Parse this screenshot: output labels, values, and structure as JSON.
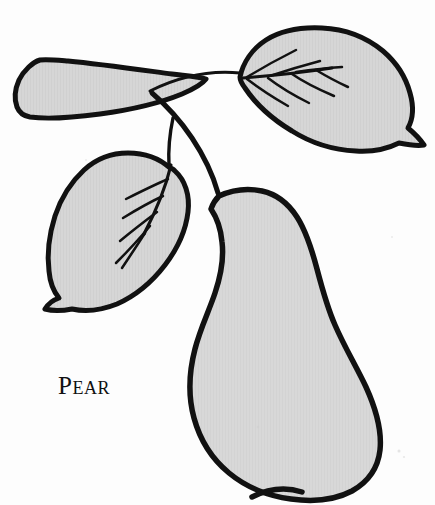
{
  "illustration": {
    "subject": "pear",
    "title": "Pear",
    "style": "hand-drawn botanical line illustration",
    "caption": {
      "text": "Pear",
      "x": 58,
      "y": 373,
      "font_size_px": 25,
      "style": "serif small-caps with large initial",
      "color": "#111111"
    },
    "palette": {
      "background": "#fdfdfd",
      "fill_gray": "#d8d8d8",
      "fill_gray_leaf": "#d5d5d5",
      "outline_black": "#111111",
      "vein_black": "#111111",
      "texture_gray": "#cfcfcf"
    },
    "stroke_widths": {
      "fruit_outline": 5.5,
      "leaf_outline": 5,
      "thin_stem": 3,
      "thick_stem": 5,
      "vein": 2.6,
      "midrib": 3.2
    },
    "parts": [
      {
        "name": "pear-fruit-body",
        "label": "Pear fruit",
        "fill": "#d8d8d8",
        "outline": "#111111",
        "bbox": [
          186,
          188,
          197,
          310
        ],
        "description": "large rounded pyriform body, narrow shoulder at top, wide lobed base at bottom"
      },
      {
        "name": "leaf-upper-right",
        "label": "Upper right leaf",
        "fill": "#d5d5d5",
        "outline": "#111111",
        "bbox": [
          232,
          29,
          192,
          122
        ],
        "vein_count": 6,
        "description": "broad ovate leaf pointing right-downward with pointed tip, midrib and six lateral veins"
      },
      {
        "name": "leaf-lower-left",
        "label": "Lower left leaf",
        "fill": "#d5d5d5",
        "outline": "#111111",
        "bbox": [
          45,
          152,
          145,
          158
        ],
        "vein_count": 4,
        "description": "ovate leaf angled down-left with pointed tip, midrib and four lateral veins"
      },
      {
        "name": "leaf-upper-left",
        "label": "Upper left leaf",
        "fill": "#d5d5d5",
        "outline": "#111111",
        "bbox": [
          16,
          55,
          180,
          75
        ],
        "vein_count": 0,
        "description": "narrow wedge-shaped leaf seen edge-on, blunt squared tip at left, tapering to stem junction at right"
      },
      {
        "name": "stem-branch-right",
        "label": "Branch to upper right leaf",
        "outline": "#111111",
        "description": "thin arcing branch from junction rising to the right leaf base"
      },
      {
        "name": "stem-branch-left",
        "label": "Branch to lower left leaf",
        "outline": "#111111",
        "description": "thin branch curving down and left from junction to the left leaf base"
      },
      {
        "name": "stem-main",
        "label": "Main stem to fruit",
        "outline": "#111111",
        "description": "thick stem descending from the junction curving right down to the pear shoulder"
      }
    ]
  }
}
